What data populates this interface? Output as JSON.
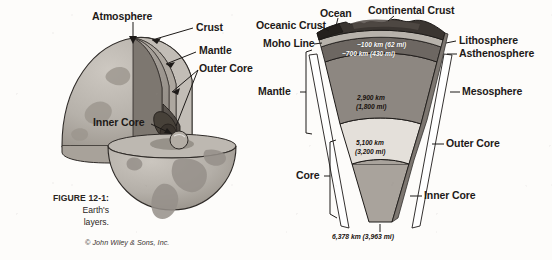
{
  "figure": {
    "caption_number": "FIGURE 12-1:",
    "caption_line1": "Earth's",
    "caption_line2": "layers.",
    "copyright": "© John Wiley & Sons, Inc."
  },
  "globe_diagram": {
    "labels": {
      "atmosphere": "Atmosphere",
      "crust": "Crust",
      "mantle": "Mantle",
      "outer_core": "Outer Core",
      "inner_core": "Inner Core"
    }
  },
  "wedge_diagram": {
    "labels": {
      "oceanic_crust": "Oceanic Crust",
      "ocean": "Ocean",
      "continental_crust": "Continental Crust",
      "moho_line": "Moho Line",
      "mantle": "Mantle",
      "core": "Core",
      "lithosphere": "Lithosphere",
      "asthenosphere": "Asthenosphere",
      "mesosphere": "Mesosphere",
      "outer_core": "Outer Core",
      "inner_core": "Inner Core"
    },
    "depths": {
      "lithosphere_thin": "~100 km (62 mi)",
      "asthenosphere_base": "~700 km (430 mi)",
      "mesosphere_base_km": "2,900 km",
      "mesosphere_base_mi": "(1,800 mi)",
      "outer_core_base_km": "5,100 km",
      "outer_core_base_mi": "(3,200 mi)",
      "earth_radius": "6,378 km (3,963 mi)"
    }
  },
  "colors": {
    "background": "#fdfcfa",
    "ink": "#1d1a18",
    "crust_dark": "#3a3531",
    "ocean_dark": "#24201d",
    "asthenosphere": "#6d6762",
    "mesosphere": "#8d8781",
    "outer_core_light": "#e4e0da",
    "inner_core": "#a9a39c",
    "globe_surface": "#b9b4ad",
    "globe_continent": "#9a948c"
  }
}
